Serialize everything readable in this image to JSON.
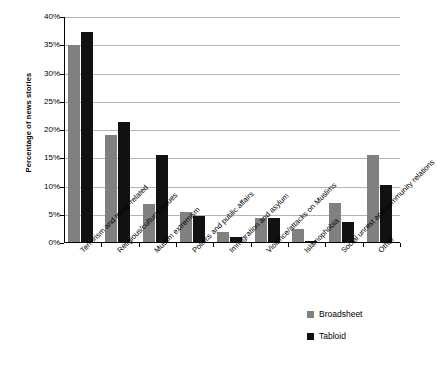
{
  "chart_data": {
    "type": "bar",
    "title": "",
    "xlabel": "",
    "ylabel": "Percentage of news stories",
    "ylim": [
      0,
      40
    ],
    "ytick_labels": [
      "40%",
      "35%",
      "30%",
      "25%",
      "20%",
      "15%",
      "10%",
      "5%",
      "0%"
    ],
    "ytick_values": [
      40,
      35,
      30,
      25,
      20,
      15,
      10,
      5,
      0
    ],
    "grid": true,
    "legend_position": "bottom-right",
    "categories": [
      "Terrorism and terror-related",
      "Religious/cultural issues",
      "Muslim extremism",
      "Politics and public affairs",
      "Immigration and asylum",
      "Violence/attacks on Muslims",
      "Islamophobia",
      "Social unrest and community relations",
      "Other"
    ],
    "series": [
      {
        "name": "Broadsheet",
        "color": "#808080",
        "values": [
          35.0,
          19.2,
          6.9,
          5.5,
          2.0,
          4.5,
          2.4,
          7.0,
          15.5
        ]
      },
      {
        "name": "Tabloid",
        "color": "#111111",
        "values": [
          37.3,
          21.5,
          15.5,
          4.7,
          1.1,
          4.5,
          0.3,
          3.7,
          10.3
        ]
      }
    ]
  }
}
